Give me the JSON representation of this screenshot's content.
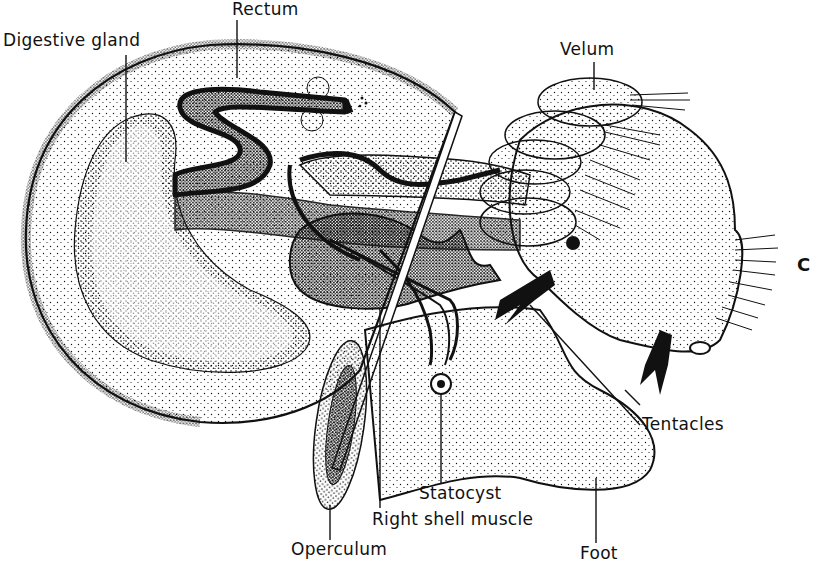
{
  "figure": {
    "plate_letter": "C",
    "colors": {
      "ink": "#111111",
      "paper": "#ffffff"
    }
  },
  "labels": [
    {
      "id": "digestive-gland",
      "text": "Digestive gland",
      "x": 3,
      "y": 32
    },
    {
      "id": "rectum",
      "text": "Rectum",
      "x": 232,
      "y": 1
    },
    {
      "id": "velum",
      "text": "Velum",
      "x": 560,
      "y": 41
    },
    {
      "id": "tentacles",
      "text": "Tentacles",
      "x": 642,
      "y": 416
    },
    {
      "id": "statocyst",
      "text": "Statocyst",
      "x": 419,
      "y": 485
    },
    {
      "id": "right-shell-muscle",
      "text": "Right shell muscle",
      "x": 372,
      "y": 511
    },
    {
      "id": "operculum",
      "text": "Operculum",
      "x": 291,
      "y": 541
    },
    {
      "id": "foot",
      "text": "Foot",
      "x": 580,
      "y": 545
    }
  ]
}
